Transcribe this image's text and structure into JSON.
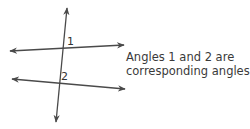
{
  "figure": {
    "type": "parallel lines cut by a transversal",
    "lines": {
      "transversal": {
        "from": [
          56,
          122
        ],
        "to": [
          67,
          8
        ]
      },
      "upper_line": {
        "from": [
          10,
          51
        ],
        "to": [
          124,
          45
        ]
      },
      "lower_line": {
        "from": [
          12,
          79
        ],
        "to": [
          125,
          89
        ]
      }
    },
    "labels": {
      "angle_1": "1",
      "angle_2": "2"
    },
    "stroke_color": "#4a4a4a"
  },
  "caption": {
    "line1": "Angles 1 and 2 are",
    "line2": "corresponding angles."
  }
}
